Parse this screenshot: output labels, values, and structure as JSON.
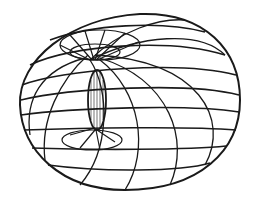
{
  "figure": {
    "stroke_color": "#1a1a1a",
    "background": "#ffffff"
  }
}
